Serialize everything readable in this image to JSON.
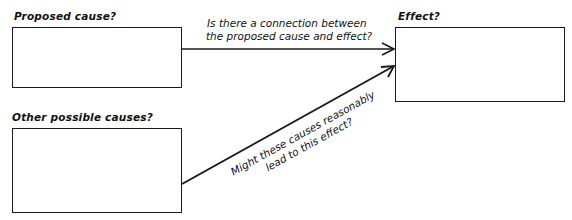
{
  "diagram": {
    "nodes": {
      "proposed_cause": {
        "label": "Proposed cause?",
        "content": ""
      },
      "effect": {
        "label": "Effect?",
        "content": ""
      },
      "other_causes": {
        "label": "Other possible causes?",
        "content": ""
      }
    },
    "edges": {
      "connection": {
        "from": "Proposed cause?",
        "to": "Effect?",
        "line1": "Is there a connection between",
        "line2": "the proposed cause and effect?"
      },
      "alternative": {
        "from": "Other possible causes?",
        "to": "Effect?",
        "line1": "Might these causes reasonably",
        "line2": "lead to this effect?"
      }
    },
    "colors": {
      "stroke": "#1a1a1a",
      "background": "#ffffff"
    }
  }
}
